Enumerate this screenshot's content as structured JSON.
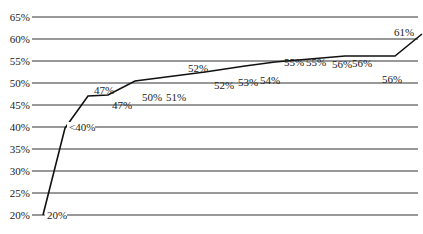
{
  "chart_data": {
    "type": "line",
    "title": "",
    "xlabel": "",
    "ylabel": "",
    "ylim": [
      20,
      65
    ],
    "grid": true,
    "legend": null,
    "y_ticks": [
      "20%",
      "25%",
      "30%",
      "35%",
      "40%",
      "45%",
      "50%",
      "55%",
      "60%",
      "65%"
    ],
    "series": [
      {
        "name": "series",
        "values": [
          20,
          40,
          47,
          47,
          50,
          51,
          52,
          52,
          53,
          54,
          55,
          55,
          56,
          56,
          56,
          61
        ]
      }
    ],
    "data_labels": [
      "20%",
      "<40%",
      "47%",
      "47%",
      "50%",
      "51%",
      "52%",
      "52%",
      "53%",
      "54%",
      "55%",
      "55%",
      "56%",
      "56%",
      "56%",
      "61%"
    ],
    "line_color": "#111111",
    "grid_color": "#333333"
  }
}
